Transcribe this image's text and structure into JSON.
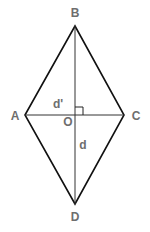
{
  "diagram": {
    "vertices": [
      {
        "id": "A",
        "label": "A",
        "x": 25,
        "y": 115,
        "lx": 15,
        "ly": 120
      },
      {
        "id": "B",
        "label": "B",
        "x": 75,
        "y": 26,
        "lx": 75,
        "ly": 17
      },
      {
        "id": "C",
        "label": "C",
        "x": 124,
        "y": 115,
        "lx": 136,
        "ly": 120
      },
      {
        "id": "D",
        "label": "D",
        "x": 75,
        "y": 204,
        "lx": 75,
        "ly": 221
      }
    ],
    "center": {
      "label": "O",
      "x": 75,
      "y": 115,
      "lx": 68,
      "ly": 125
    },
    "diagonal_labels": {
      "short": {
        "label": "d'",
        "x": 58,
        "y": 108
      },
      "long": {
        "label": "d",
        "x": 83,
        "y": 149
      }
    },
    "right_angle_marker": {
      "size": 8
    },
    "colors": {
      "edge": "#111111",
      "label": "#6e6e6e",
      "background": "#ffffff"
    }
  }
}
